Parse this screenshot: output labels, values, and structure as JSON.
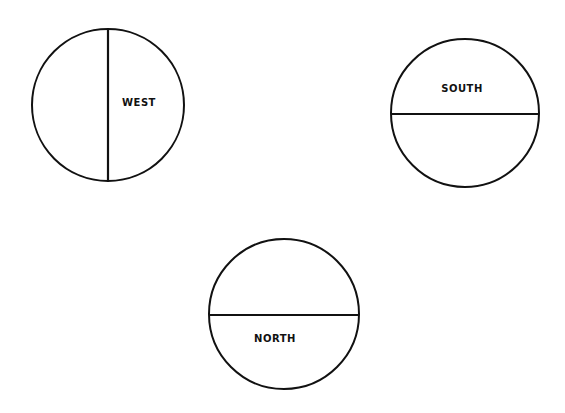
{
  "diagram": {
    "circles": [
      {
        "id": "west",
        "label": "WEST",
        "cx": 108,
        "cy": 105,
        "r": 76,
        "divider": "vertical",
        "label_x": 139,
        "label_y": 106
      },
      {
        "id": "south",
        "label": "SOUTH",
        "cx": 465,
        "cy": 113,
        "r": 74,
        "divider": "horizontal",
        "label_x": 462,
        "label_y": 92
      },
      {
        "id": "north",
        "label": "NORTH",
        "cx": 284,
        "cy": 314,
        "r": 75,
        "divider": "horizontal",
        "label_x": 275,
        "label_y": 342
      }
    ],
    "colors": {
      "stroke": "#111111",
      "background": "#ffffff"
    }
  }
}
